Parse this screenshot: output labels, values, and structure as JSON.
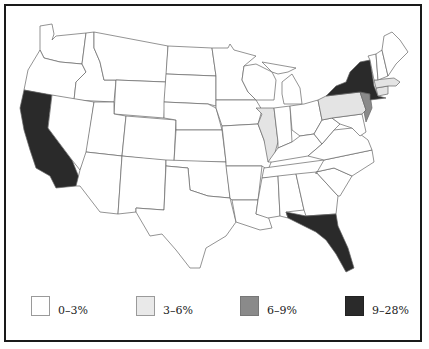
{
  "map": {
    "subject": "United States by state, shaded by percentage category",
    "colors": {
      "c0": "#ffffff",
      "c1": "#e4e4e4",
      "c2": "#8a8a8a",
      "c3": "#2a2a2a"
    },
    "highlighted_states": [
      {
        "state": "California",
        "category": "9–28%"
      },
      {
        "state": "New York",
        "category": "9–28%"
      },
      {
        "state": "Florida",
        "category": "9–28%"
      },
      {
        "state": "New Jersey",
        "category": "6–9%"
      },
      {
        "state": "Illinois",
        "category": "3–6%"
      },
      {
        "state": "Pennsylvania",
        "category": "3–6%"
      },
      {
        "state": "Massachusetts",
        "category": "3–6%"
      },
      {
        "state": "Connecticut",
        "category": "3–6%"
      }
    ],
    "default_category": "0–3%"
  },
  "legend": {
    "items": [
      {
        "label": "0–3%",
        "color": "#ffffff"
      },
      {
        "label": "3–6%",
        "color": "#e4e4e4"
      },
      {
        "label": "6–9%",
        "color": "#8a8a8a"
      },
      {
        "label": "9–28%",
        "color": "#2a2a2a"
      }
    ]
  }
}
